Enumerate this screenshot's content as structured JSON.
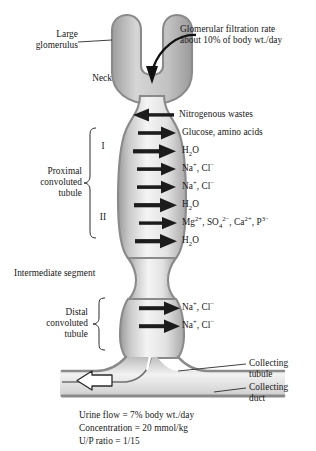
{
  "figure": {
    "title_absent": true,
    "structure_labels": {
      "large_glomerulus": "Large\nglomerulus",
      "neck": "Neck",
      "proximal": "Proximal\nconvoluted\ntubule",
      "segment_I": "I",
      "segment_II": "II",
      "intermediate": "Intermediate segment",
      "distal": "Distal\nconvoluted\ntubule",
      "collecting_tubule": "Collecting\ntubule",
      "collecting_duct": "Collecting\nduct"
    },
    "glomerulus_note": {
      "line1": "Glomerular filtration rate",
      "line2": "about 10% of body wt./day"
    },
    "transport_arrows": [
      {
        "label_html": "Nitrogenous wastes",
        "direction": "left",
        "y": 115
      },
      {
        "label_html": "Glucose, amino acids",
        "direction": "right",
        "y": 133
      },
      {
        "label_html": "H<sub>2</sub>O",
        "direction": "right",
        "y": 151
      },
      {
        "label_html": "Na<sup>+</sup>, Cl<sup>−</sup>",
        "direction": "right",
        "y": 169
      },
      {
        "label_html": "Na<sup>+</sup>, Cl<sup>−</sup>",
        "direction": "right",
        "y": 187
      },
      {
        "label_html": "H<sub>2</sub>O",
        "direction": "right",
        "y": 205
      },
      {
        "label_html": "Mg<sup>2+</sup>, SO<sub>4</sub><sup>2−</sup>, Ca<sup>2+</sup>, P<sup>3−</sup>",
        "direction": "right",
        "y": 223
      },
      {
        "label_html": "H<sub>2</sub>O",
        "direction": "right",
        "y": 241
      },
      {
        "label_html": "Na<sup>+</sup>, Cl<sup>−</sup>",
        "direction": "right",
        "y": 308
      },
      {
        "label_html": "Na<sup>+</sup>, Cl<sup>−</sup>",
        "direction": "right",
        "y": 326
      }
    ],
    "summary": {
      "line1": "Urine flow = 7% body wt./day",
      "line2": "Concentration = 20 mmol/kg",
      "line3": "U/P ratio = 1/15"
    },
    "colors": {
      "outline": "#8a8a8a",
      "wall_dark": "#7d7d7d",
      "lumen_light": "#f2f2f2",
      "arrow": "#1c1c1c",
      "text": "#161616"
    }
  }
}
